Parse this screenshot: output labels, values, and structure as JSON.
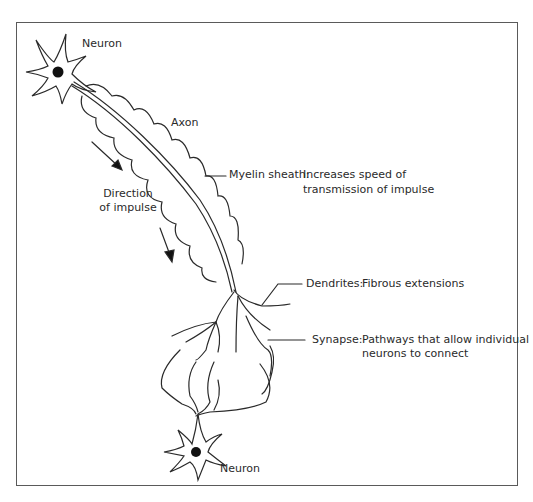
{
  "diagram": {
    "labels": {
      "neuron_top": "Neuron",
      "neuron_bottom": "Neuron",
      "axon": "Axon",
      "direction_line1": "Direction",
      "direction_line2": "of impulse"
    },
    "callouts": [
      {
        "term": "Myelin sheath:",
        "line1": "Increases speed of",
        "line2": "transmission of impulse"
      },
      {
        "term": "Dendrites:",
        "line1": "Fibrous extensions",
        "line2": ""
      },
      {
        "term": "Synapse:",
        "line1": "Pathways that allow individual",
        "line2": "neurons to connect"
      }
    ],
    "colors": {
      "stroke": "#2a2a2a",
      "frame": "#5a5a5a",
      "background": "#ffffff"
    }
  }
}
